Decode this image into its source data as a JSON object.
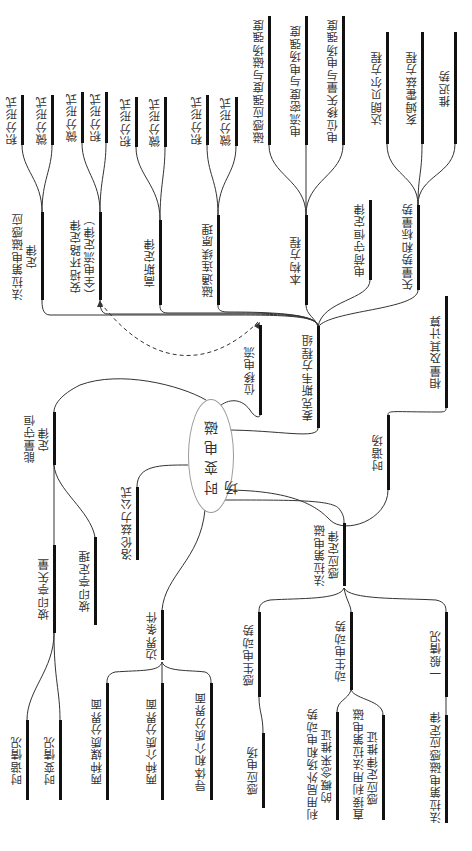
{
  "diagram": {
    "title": "时变电磁场",
    "orientation": "rotated-90-ccw",
    "center": {
      "label": "时变电磁场",
      "cx": 210,
      "cy": 455,
      "rx": 22,
      "ry": 56
    },
    "nodes": [
      {
        "id": "maxwell",
        "label": "麦克斯韦方程组",
        "x": 318,
        "y1": 326,
        "y2": 428,
        "parent": "center"
      },
      {
        "id": "faraday_law",
        "label": "法拉第电磁感应\n定律",
        "x": 42,
        "y1": 212,
        "y2": 300,
        "parent": "maxwell"
      },
      {
        "id": "ampere_law",
        "label": "安培环路定律\n（全电流定律）",
        "x": 100,
        "y1": 212,
        "y2": 300,
        "parent": "maxwell"
      },
      {
        "id": "gauss_law",
        "label": "高斯定律",
        "x": 160,
        "y1": 220,
        "y2": 305,
        "parent": "maxwell"
      },
      {
        "id": "flux_continuity",
        "label": "磁通连续原理",
        "x": 218,
        "y1": 215,
        "y2": 305,
        "parent": "maxwell"
      },
      {
        "id": "constitutive",
        "label": "本构方程",
        "x": 306,
        "y1": 215,
        "y2": 305,
        "parent": "maxwell"
      },
      {
        "id": "charge_conservation",
        "label": "电荷守恒定律",
        "x": 370,
        "y1": 200,
        "y2": 280,
        "parent": "maxwell"
      },
      {
        "id": "potentials",
        "label": "矢量势和标量势",
        "x": 418,
        "y1": 205,
        "y2": 290,
        "parent": "maxwell"
      },
      {
        "id": "f_int",
        "label": "积分形式",
        "x": 22,
        "y1": 95,
        "y2": 145,
        "parent": "faraday_law"
      },
      {
        "id": "f_diff",
        "label": "微分形式",
        "x": 52,
        "y1": 95,
        "y2": 145,
        "parent": "faraday_law"
      },
      {
        "id": "a_diff",
        "label": "微分形式",
        "x": 82,
        "y1": 92,
        "y2": 143,
        "parent": "ampere_law"
      },
      {
        "id": "a_int",
        "label": "积分形式",
        "x": 106,
        "y1": 92,
        "y2": 143,
        "parent": "ampere_law"
      },
      {
        "id": "g_int",
        "label": "积分形式",
        "x": 136,
        "y1": 97,
        "y2": 147,
        "parent": "gauss_law"
      },
      {
        "id": "g_diff",
        "label": "微分形式",
        "x": 165,
        "y1": 97,
        "y2": 147,
        "parent": "gauss_law"
      },
      {
        "id": "m_int",
        "label": "积分形式",
        "x": 207,
        "y1": 95,
        "y2": 145,
        "parent": "flux_continuity"
      },
      {
        "id": "m_diff",
        "label": "微分形式",
        "x": 236,
        "y1": 97,
        "y2": 146,
        "parent": "flux_continuity"
      },
      {
        "id": "c_b",
        "label": "磁感应强度与磁场强度",
        "x": 269,
        "y1": 16,
        "y2": 145,
        "parent": "constitutive"
      },
      {
        "id": "c_j",
        "label": "电流密度与电场强度",
        "x": 306,
        "y1": 16,
        "y2": 145,
        "parent": "constitutive"
      },
      {
        "id": "c_d",
        "label": "电位移矢量与电场强度",
        "x": 343,
        "y1": 16,
        "y2": 145,
        "parent": "constitutive"
      },
      {
        "id": "p_dalembert",
        "label": "达朗贝尔方程",
        "x": 387,
        "y1": 32,
        "y2": 144,
        "parent": "potentials"
      },
      {
        "id": "p_helmholtz",
        "label": "亥姆霍兹方程",
        "x": 422,
        "y1": 32,
        "y2": 144,
        "parent": "potentials"
      },
      {
        "id": "p_retarded",
        "label": "推迟势",
        "x": 455,
        "y1": 32,
        "y2": 144,
        "parent": "potentials"
      },
      {
        "id": "displacement",
        "label": "位移电流",
        "x": 260,
        "y1": 325,
        "y2": 415,
        "parent": "center"
      },
      {
        "id": "harmonic",
        "label": "时谐场",
        "x": 388,
        "y1": 415,
        "y2": 490,
        "parent": "center"
      },
      {
        "id": "phasor",
        "label": "相量及其计算",
        "x": 446,
        "y1": 296,
        "y2": 408,
        "parent": "harmonic"
      },
      {
        "id": "energy",
        "label": "能量守恒\n定律",
        "x": 54,
        "y1": 412,
        "y2": 465,
        "parent": "center"
      },
      {
        "id": "poynting_vec",
        "label": "坡印亭矢量",
        "x": 54,
        "y1": 545,
        "y2": 633,
        "parent": "energy"
      },
      {
        "id": "poynting_thm",
        "label": "坡印亭定理",
        "x": 95,
        "y1": 537,
        "y2": 625,
        "parent": "energy"
      },
      {
        "id": "static_case",
        "label": "时谐情况",
        "x": 27,
        "y1": 720,
        "y2": 800,
        "parent": "poynting_vec"
      },
      {
        "id": "varying_case",
        "label": "时变情况",
        "x": 60,
        "y1": 720,
        "y2": 800,
        "parent": "poynting_vec"
      },
      {
        "id": "lorentz",
        "label": "洛伦兹力公式",
        "x": 137,
        "y1": 487,
        "y2": 560,
        "parent": "center"
      },
      {
        "id": "boundary",
        "label": "边界条件",
        "x": 162,
        "y1": 610,
        "y2": 660,
        "parent": "center"
      },
      {
        "id": "b_two_media",
        "label": "两种媒质分界面",
        "x": 107,
        "y1": 683,
        "y2": 800,
        "parent": "boundary"
      },
      {
        "id": "b_two_dielectric",
        "label": "两种介质分界面",
        "x": 162,
        "y1": 683,
        "y2": 800,
        "parent": "boundary"
      },
      {
        "id": "b_conductor",
        "label": "导体和介质分界面",
        "x": 211,
        "y1": 683,
        "y2": 800,
        "parent": "boundary"
      },
      {
        "id": "faraday_branch",
        "label": "法拉第电磁\n感应定律",
        "x": 344,
        "y1": 523,
        "y2": 586,
        "parent": "center"
      },
      {
        "id": "induced_emf",
        "label": "感生电动势",
        "x": 259,
        "y1": 612,
        "y2": 697,
        "parent": "faraday_branch"
      },
      {
        "id": "induced_field",
        "label": "感应电场",
        "x": 263,
        "y1": 733,
        "y2": 808,
        "parent": "induced_emf"
      },
      {
        "id": "motional_emf",
        "label": "动生电动势",
        "x": 351,
        "y1": 612,
        "y2": 690,
        "parent": "faraday_branch"
      },
      {
        "id": "motional_local",
        "label": "利用局外场和电动势\n的概念来推证",
        "x": 337,
        "y1": 712,
        "y2": 820,
        "parent": "motional_emf"
      },
      {
        "id": "motional_direct",
        "label": "直接利用法拉第电磁\n感应定律推证",
        "x": 383,
        "y1": 715,
        "y2": 820,
        "parent": "motional_emf"
      },
      {
        "id": "general_case",
        "label": "一般情况",
        "x": 446,
        "y1": 612,
        "y2": 697,
        "parent": "faraday_branch"
      },
      {
        "id": "faraday_law_leaf",
        "label": "法拉第电磁感应定律",
        "x": 446,
        "y1": 715,
        "y2": 823,
        "parent": "general_case"
      }
    ],
    "dashed_links": [
      {
        "from": "displacement",
        "to": "ampere_law",
        "style": "dashed-arrow"
      }
    ]
  }
}
